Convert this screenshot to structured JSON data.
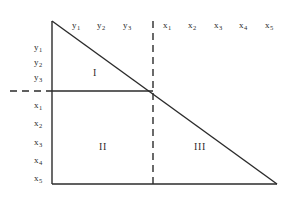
{
  "figure": {
    "type": "geometric-diagram",
    "background_color": "#ffffff",
    "line_color": "#2b2b2b",
    "text_color": "#2b2b2b"
  },
  "axes": {
    "top_labels": [
      {
        "base": "y",
        "sub": "1",
        "x": 76
      },
      {
        "base": "y",
        "sub": "2",
        "x": 101
      },
      {
        "base": "y",
        "sub": "3",
        "x": 127
      },
      {
        "base": "x",
        "sub": "1",
        "x": 167
      },
      {
        "base": "x",
        "sub": "2",
        "x": 192
      },
      {
        "base": "x",
        "sub": "3",
        "x": 218
      },
      {
        "base": "x",
        "sub": "4",
        "x": 243
      },
      {
        "base": "x",
        "sub": "5",
        "x": 269
      }
    ],
    "top_labels_y": 21,
    "left_labels": [
      {
        "base": "y",
        "sub": "1",
        "y": 47
      },
      {
        "base": "y",
        "sub": "2",
        "y": 62
      },
      {
        "base": "y",
        "sub": "3",
        "y": 77
      },
      {
        "base": "x",
        "sub": "1",
        "y": 105
      },
      {
        "base": "x",
        "sub": "2",
        "y": 123
      },
      {
        "base": "x",
        "sub": "3",
        "y": 142
      },
      {
        "base": "x",
        "sub": "4",
        "y": 160
      },
      {
        "base": "x",
        "sub": "5",
        "y": 178
      }
    ],
    "left_labels_x": 38
  },
  "regions": [
    {
      "label": "I",
      "x": 95,
      "y": 72
    },
    {
      "label": "II",
      "x": 103,
      "y": 146
    },
    {
      "label": "III",
      "x": 200,
      "y": 146
    }
  ],
  "geometry": {
    "apex": {
      "x": 52,
      "y": 21
    },
    "origin": {
      "x": 52,
      "y": 184
    },
    "base_right": {
      "x": 277,
      "y": 184
    },
    "intersection": {
      "x": 153,
      "y": 91
    },
    "vertical_axis": {
      "x": 52,
      "y1": 21,
      "y2": 184
    },
    "baseline": {
      "y": 184,
      "x1": 52,
      "x2": 277
    },
    "hypotenuse": {
      "x1": 52,
      "y1": 21,
      "x2": 277,
      "y2": 184
    },
    "solid_horizontal": {
      "y": 91,
      "x1": 52,
      "x2": 153
    },
    "dashed_horizontal_stub": {
      "y": 91,
      "x1": 10,
      "x2": 52
    },
    "dashed_vertical": {
      "x": 153,
      "y1": 21,
      "y2": 184
    },
    "stroke_width": 1.4,
    "dash_pattern": "7 5"
  }
}
